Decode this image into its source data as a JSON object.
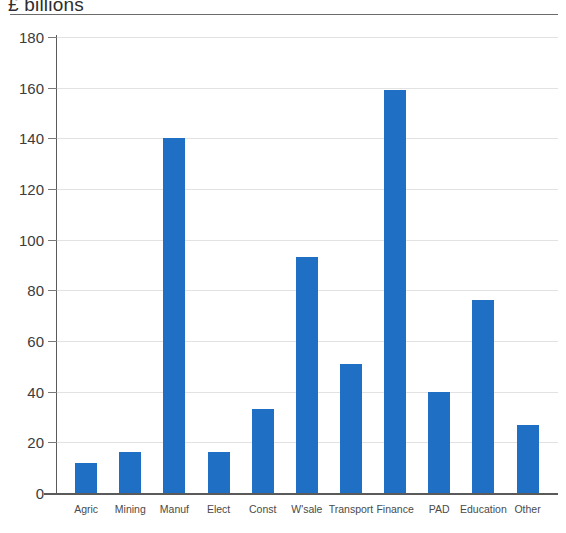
{
  "chart_data": {
    "type": "bar",
    "title": "£ billions",
    "xlabel": "",
    "ylabel": "",
    "ylim": [
      0,
      180
    ],
    "yticks": [
      0,
      20,
      40,
      60,
      80,
      100,
      120,
      140,
      160,
      180
    ],
    "grid": true,
    "legend": false,
    "bar_color": "#1f6fc4",
    "categories": [
      "Agric",
      "Mining",
      "Manuf",
      "Elect",
      "Const",
      "W'sale",
      "Transport",
      "Finance",
      "PAD",
      "Education",
      "Other"
    ],
    "values": [
      12,
      16,
      140,
      16,
      33,
      93,
      51,
      159,
      40,
      76,
      27
    ]
  }
}
